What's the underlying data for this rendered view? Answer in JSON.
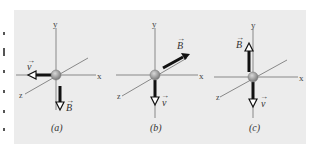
{
  "figure": {
    "panels": [
      {
        "id": "a",
        "caption": "(a)",
        "velocity_label": "v",
        "field_label": "B",
        "velocity_dir": "-x",
        "field_dir": "-y"
      },
      {
        "id": "b",
        "caption": "(b)",
        "velocity_label": "v",
        "field_label": "B",
        "velocity_dir": "-y",
        "field_dir": "+x+y diagonal"
      },
      {
        "id": "c",
        "caption": "(c)",
        "velocity_label": "v",
        "field_label": "B",
        "velocity_dir": "-y",
        "field_dir": "+y"
      }
    ],
    "axes": {
      "x": "x",
      "y": "y",
      "z": "z"
    },
    "colors": {
      "background": "#ececec",
      "axis": "#888888",
      "arrow": "#111111",
      "particle": "#9a9a9a"
    }
  }
}
